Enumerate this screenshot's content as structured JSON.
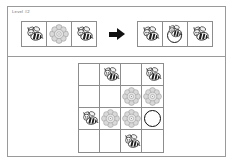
{
  "window": {
    "title": "Bee Puzzle Level",
    "background": "#ffffff",
    "border_color": "#9a9a9a"
  },
  "rule_panel": {
    "label": "Level #2",
    "arrow_icon": "right-arrow-icon",
    "before": {
      "cells": [
        {
          "icon": "bee-icon",
          "label": "Bee"
        },
        {
          "icon": "flower-icon",
          "label": "Flower"
        },
        {
          "icon": "bee-icon",
          "label": "Bee"
        }
      ]
    },
    "after": {
      "cells": [
        {
          "icon": "bee-icon",
          "label": "Bee"
        },
        {
          "icon": "bee-in-hole-icon",
          "label": "Bee in hole"
        },
        {
          "icon": "bee-icon",
          "label": "Bee"
        }
      ]
    }
  },
  "board": {
    "rows": 4,
    "cols": 4,
    "cells": [
      {
        "icon": "empty",
        "label": "Empty"
      },
      {
        "icon": "bee-icon",
        "label": "Bee"
      },
      {
        "icon": "empty",
        "label": "Empty"
      },
      {
        "icon": "bee-icon",
        "label": "Bee"
      },
      {
        "icon": "empty",
        "label": "Empty"
      },
      {
        "icon": "empty",
        "label": "Empty"
      },
      {
        "icon": "flower-icon",
        "label": "Flower"
      },
      {
        "icon": "flower-icon",
        "label": "Flower"
      },
      {
        "icon": "bee-icon",
        "label": "Bee"
      },
      {
        "icon": "flower-icon",
        "label": "Flower"
      },
      {
        "icon": "flower-icon",
        "label": "Flower"
      },
      {
        "icon": "goal-ring-icon",
        "label": "Goal hole"
      },
      {
        "icon": "empty",
        "label": "Empty"
      },
      {
        "icon": "empty",
        "label": "Empty"
      },
      {
        "icon": "bee-icon",
        "label": "Bee"
      },
      {
        "icon": "empty",
        "label": "Empty"
      }
    ]
  },
  "colors": {
    "grid_line": "#8d8d8d",
    "frame": "#9a9a9a",
    "arrow": "#111111",
    "ring_stroke": "#0c0c0c",
    "flower_fill": "#d7d7d7",
    "bee_body": "#1f1f1f",
    "label_text": "#6e6e6e"
  }
}
